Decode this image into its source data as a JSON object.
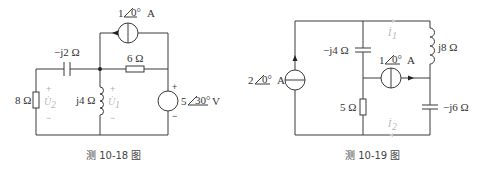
{
  "figures": [
    {
      "caption": "测 10-18 图",
      "components": {
        "current_source": {
          "label": "1",
          "angle": "0°",
          "unit": "A"
        },
        "capacitor": {
          "label": "−j2 Ω"
        },
        "resistor_series": {
          "label": "6 Ω"
        },
        "resistor_left": {
          "label": "8 Ω"
        },
        "inductor": {
          "label": "j4 Ω"
        },
        "voltage_source": {
          "label": "5",
          "angle": "30°",
          "unit": "V"
        }
      },
      "voltages": {
        "u2": {
          "symbol": "U̇",
          "sub": "2",
          "plus": "+",
          "minus": "−"
        },
        "u1": {
          "symbol": "U̇",
          "sub": "1",
          "plus": "+",
          "minus": "−"
        },
        "vs": {
          "plus": "+",
          "minus": "−"
        }
      }
    },
    {
      "caption": "测 10-19 图",
      "components": {
        "current_source_left": {
          "label": "2",
          "angle": "0°",
          "unit": "A"
        },
        "capacitor_left": {
          "label": "−j4 Ω"
        },
        "resistor": {
          "label": "5 Ω"
        },
        "current_source_mid": {
          "label": "1",
          "angle": "0°",
          "unit": "A"
        },
        "inductor": {
          "label": "j8 Ω"
        },
        "capacitor_right": {
          "label": "−j6 Ω"
        }
      },
      "currents": {
        "i1": {
          "symbol": "İ",
          "sub": "1"
        },
        "i2": {
          "symbol": "İ",
          "sub": "2"
        }
      }
    }
  ],
  "colors": {
    "wire": "#3a3a3a",
    "faint_label": "#b8b8b8",
    "background": "#ffffff"
  }
}
